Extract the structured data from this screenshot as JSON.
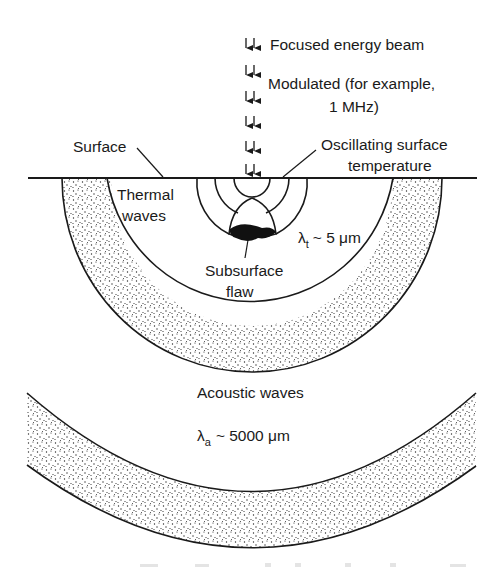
{
  "figure": {
    "type": "photothermal / photoacoustic diagram",
    "labels": {
      "beam": "Focused energy beam",
      "modulated_line1": "Modulated (for example,",
      "modulated_line2": "1 MHz)",
      "surface": "Surface",
      "oscillating_line1": "Oscillating surface",
      "oscillating_line2": "temperature",
      "thermal_line1": "Thermal",
      "thermal_line2": "waves",
      "thermal_lambda_symbol": "λ",
      "thermal_lambda_sub": "t",
      "thermal_lambda_value": "~ 5 μm",
      "flaw_line1": "Subsurface",
      "flaw_line2": "flaw",
      "acoustic": "Acoustic waves",
      "acoustic_lambda_symbol": "λ",
      "acoustic_lambda_sub": "a",
      "acoustic_lambda_value": "~ 5000 μm"
    },
    "colors": {
      "ink": "#1a1a1a",
      "background": "#ffffff",
      "stipple": "#2a2a2a"
    }
  }
}
